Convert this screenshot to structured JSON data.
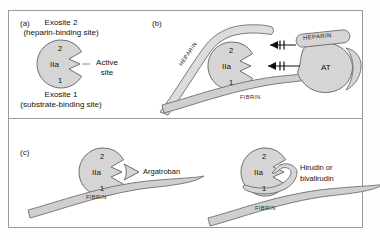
{
  "figure": {
    "panels": [
      {
        "id": "a",
        "label": "(a)",
        "caption_top_line1": "Exosite 2",
        "caption_top_line2": "(heparin-binding site)",
        "caption_bottom_line1": "Exosite 1",
        "caption_bottom_line2": "(substrate-binding site)",
        "enzyme_label": "IIa",
        "exosite2_label": "2",
        "exosite1_label": "1",
        "active_site_line1": "Active",
        "active_site_line2": "site"
      },
      {
        "id": "b",
        "label": "(b)",
        "enzyme_label": "IIa",
        "exosite2_label": "2",
        "exosite1_label": "1",
        "heparin_band_label": "HEPARIN",
        "heparin_box_label": "HEPARIN",
        "antithrombin_label": "AT",
        "fibrin_label": "FIBRIN",
        "inhibition_symbol": "blocked-arrow"
      },
      {
        "id": "c",
        "label": "(c)",
        "left": {
          "enzyme_label": "IIa",
          "exosite2_label": "2",
          "exosite1_label": "1",
          "fibrin_label": "FIBRIN",
          "drug_label": "Argatroban"
        },
        "right": {
          "enzyme_label": "IIa",
          "exosite2_label": "2",
          "exosite1_label": "1",
          "fibrin_label": "FIBRIN",
          "drug_label_line1": "Hirudin or",
          "drug_label_line2": "bivalirudin"
        }
      }
    ],
    "colors": {
      "shape_fill": "#d5d5d5",
      "shape_stroke": "#6e6e6e",
      "ribbon_fill": "#cfcfcf",
      "frame_stroke": "#9a9a9a",
      "text": "#111111",
      "background": "#ffffff"
    }
  }
}
